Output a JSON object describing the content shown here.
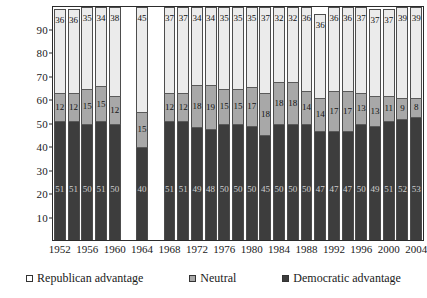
{
  "chart_data": {
    "type": "bar",
    "subtype": "stacked-bar-100",
    "title": "",
    "xlabel": "",
    "ylabel": "",
    "ylim": [
      0,
      100
    ],
    "yticks": [
      10,
      20,
      30,
      40,
      50,
      60,
      70,
      80,
      90
    ],
    "grid": false,
    "legend_position": "bottom",
    "categories": [
      "1952",
      "1954",
      "1956",
      "1958",
      "1960",
      "1962",
      "1964",
      "1966",
      "1968",
      "1970",
      "1972",
      "1974",
      "1976",
      "1978",
      "1980",
      "1982",
      "1984",
      "1986",
      "1988",
      "1990",
      "1992",
      "1994",
      "1996",
      "1998",
      "2000",
      "2002",
      "2004"
    ],
    "tick_labels": [
      "1952",
      "",
      "1956",
      "",
      "1960",
      "",
      "1964",
      "",
      "1968",
      "",
      "1972",
      "",
      "1976",
      "",
      "1980",
      "",
      "1984",
      "",
      "1988",
      "",
      "1992",
      "",
      "1996",
      "",
      "2000",
      "",
      "2004"
    ],
    "series": [
      {
        "name": "Democratic advantage",
        "color": "#3d3d3d",
        "values": [
          51,
          51,
          50,
          51,
          50,
          null,
          40,
          null,
          51,
          51,
          49,
          48,
          50,
          50,
          50,
          45,
          50,
          50,
          50,
          47,
          47,
          47,
          50,
          49,
          51,
          52,
          53
        ]
      },
      {
        "name": "Neutral",
        "color": "#a8a8a8",
        "values": [
          12,
          12,
          15,
          15,
          12,
          null,
          15,
          null,
          12,
          12,
          18,
          19,
          15,
          15,
          17,
          18,
          18,
          18,
          14,
          14,
          17,
          17,
          13,
          13,
          11,
          9,
          8
        ]
      },
      {
        "name": "Republican advantage",
        "color": "#ebebeb",
        "values": [
          36,
          36,
          35,
          34,
          38,
          null,
          45,
          null,
          37,
          37,
          34,
          34,
          35,
          35,
          35,
          37,
          32,
          32,
          36,
          36,
          36,
          36,
          37,
          37,
          37,
          39,
          39
        ]
      }
    ]
  },
  "legend": {
    "items": [
      {
        "label": "Republican advantage",
        "swatch": "sw-rep"
      },
      {
        "label": "Neutral",
        "swatch": "sw-neu"
      },
      {
        "label": "Democratic advantage",
        "swatch": "sw-dem"
      }
    ]
  }
}
